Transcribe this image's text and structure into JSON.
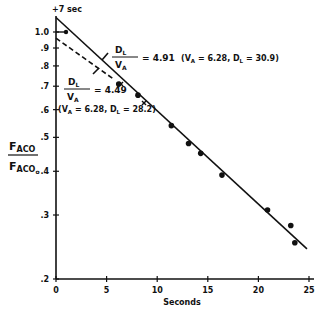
{
  "chart_data": {
    "type": "scatter",
    "title": "",
    "xlabel": "Seconds",
    "ylabel_num": "F",
    "ylabel_num_sub": "ACO",
    "ylabel_den": "F",
    "ylabel_den_sub": "ACO",
    "ylabel_den_subsub": "o",
    "y_scale": "log",
    "xlim": [
      0,
      25
    ],
    "ylim": [
      0.2,
      1.0
    ],
    "x_ticks": [
      "0",
      "5",
      "10",
      "15",
      "20",
      "25"
    ],
    "y_ticks": [
      "1.0",
      ".9",
      ".8",
      ".7",
      ".6",
      ".5",
      ".4",
      ".3",
      ".2"
    ],
    "top_annotation": "+7 sec",
    "series": [
      {
        "name": "measured",
        "style": "points",
        "x": [
          6.2,
          8.1,
          11.4,
          13.1,
          14.3,
          16.4,
          20.9,
          23.2,
          23.6
        ],
        "y": [
          0.71,
          0.66,
          0.54,
          0.48,
          0.45,
          0.39,
          0.31,
          0.28,
          0.25
        ]
      },
      {
        "name": "fit D_L/V_A = 4.91",
        "style": "solid",
        "x": [
          0,
          24.8
        ],
        "y": [
          1.1,
          0.24
        ]
      },
      {
        "name": "fit D_L/V_A = 4.49",
        "style": "dashed",
        "x": [
          0,
          5.8
        ],
        "y": [
          0.96,
          0.73
        ]
      }
    ],
    "annotations": [
      {
        "ratio_num": "D",
        "ratio_num_sub": "L",
        "ratio_den": "V",
        "ratio_den_sub": "A",
        "value": "= 4.91",
        "params": "(V",
        "params_a": "A",
        "params_mid": " = 6.28, D",
        "params_l": "L",
        "params_end": " = 30.9)"
      },
      {
        "ratio_num": "D",
        "ratio_num_sub": "L",
        "ratio_den": "V",
        "ratio_den_sub": "A",
        "value": "= 4.49",
        "params": "(V",
        "params_a": "A",
        "params_mid": " = 6.28, D",
        "params_l": "L",
        "params_end": " = 28.2)"
      }
    ],
    "grid": false,
    "legend": "none"
  }
}
